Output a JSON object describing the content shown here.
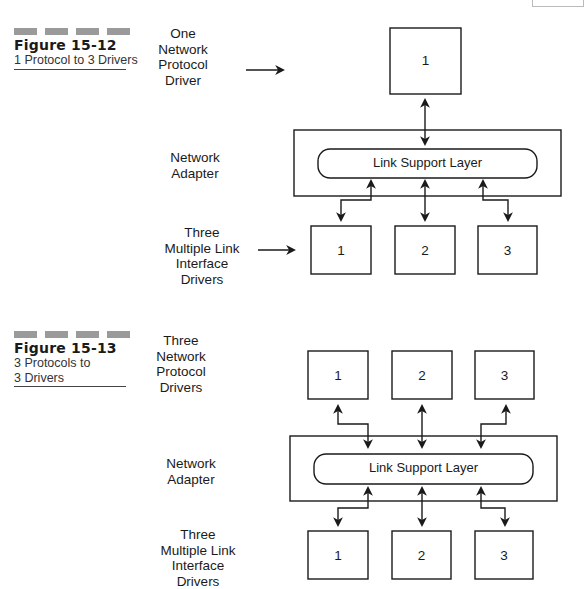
{
  "figures": [
    {
      "number": "Figure 15-12",
      "caption": "1 Protocol to 3 Drivers",
      "labels": {
        "protocol": [
          "One",
          "Network",
          "Protocol",
          "Driver"
        ],
        "adapter": [
          "Network",
          "Adapter"
        ],
        "mlid": [
          "Three",
          "Multiple Link",
          "Interface",
          "Drivers"
        ]
      },
      "protocol_boxes": [
        "1"
      ],
      "link_support_layer": "Link Support Layer",
      "driver_boxes": [
        "1",
        "2",
        "3"
      ]
    },
    {
      "number": "Figure 15-13",
      "caption": "3 Protocols to\n3 Drivers",
      "caption_lines": [
        "3 Protocols to",
        "3 Drivers"
      ],
      "labels": {
        "protocol": [
          "Three",
          "Network",
          "Protocol",
          "Drivers"
        ],
        "adapter": [
          "Network",
          "Adapter"
        ],
        "mlid": [
          "Three",
          "Multiple Link",
          "Interface",
          "Drivers"
        ]
      },
      "protocol_boxes": [
        "1",
        "2",
        "3"
      ],
      "link_support_layer": "Link Support Layer",
      "driver_boxes": [
        "1",
        "2",
        "3"
      ]
    }
  ]
}
